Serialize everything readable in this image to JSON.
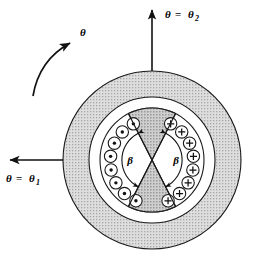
{
  "figure": {
    "center": {
      "x": 152,
      "y": 160
    },
    "colors": {
      "outline": "#1a1a1a",
      "ring_fill": "#d8d8d8",
      "wedge_fill": "#c9c9c9",
      "background": "#ffffff",
      "hatch": "#9a9a9a"
    },
    "geometry": {
      "outer_ring_outer_radius": 89,
      "outer_ring_inner_radius": 63,
      "stator_outer_radius": 52,
      "coil_ring_outer_radius": 50,
      "coil_ring_inner_radius": 28,
      "coil_circle_radius": 6.2,
      "wedge_half_angle_deg": 27,
      "beta_arc_radius": 30
    }
  },
  "labels": {
    "theta_rotation": {
      "symbol": "θ",
      "name": "rotation-angle"
    },
    "theta_one": {
      "symbol": "θ",
      "equals": "=",
      "sub_symbol": "θ",
      "subscript": "1",
      "full": "θ = θ₁",
      "position": "left"
    },
    "theta_two": {
      "symbol": "θ",
      "equals": "=",
      "sub_symbol": "θ",
      "subscript": "2",
      "full": "θ = θ₂",
      "position": "top"
    },
    "beta_left": {
      "symbol": "β",
      "name": "beta-angle-left"
    },
    "beta_right": {
      "symbol": "β",
      "name": "beta-angle-right"
    }
  },
  "coils": {
    "left_group": {
      "symbol": "⊙",
      "meaning": "current-out-of-page",
      "glyph": "dot",
      "count": 8
    },
    "right_group": {
      "symbol": "⊕",
      "meaning": "current-into-page",
      "glyph": "plus",
      "count": 8
    }
  },
  "arrows": {
    "theta_two_arrow": {
      "direction": "up",
      "name": "theta-two-arrow"
    },
    "theta_one_arrow": {
      "direction": "left",
      "name": "theta-one-arrow"
    },
    "rotation_arrow": {
      "direction": "counterclockwise-curved",
      "name": "rotation-direction-arrow"
    }
  }
}
